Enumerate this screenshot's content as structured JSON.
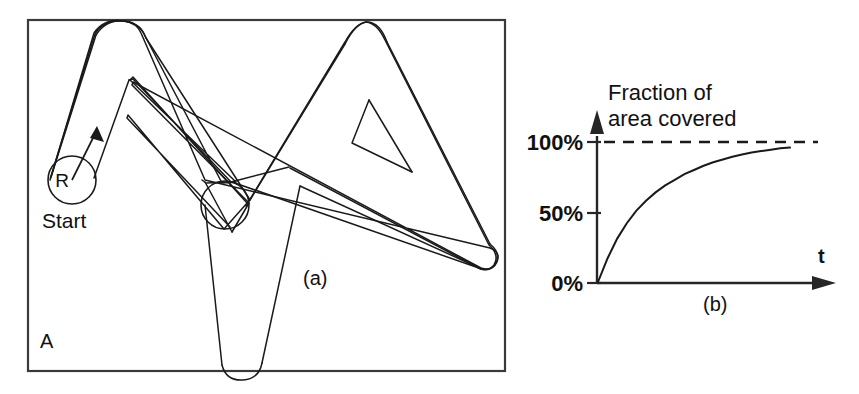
{
  "figure": {
    "panels": [
      {
        "id": "panel-a",
        "caption": "(a)",
        "region_label": "A",
        "start_label": "Start",
        "radius_label": "R",
        "description": "Coverage path of a disc robot inside region A"
      },
      {
        "id": "panel-b",
        "caption": "(b)",
        "title_line1": "Fraction of",
        "title_line2": "area covered",
        "x_axis_label": "t",
        "y_ticks": [
          "100%",
          "50%",
          "0%"
        ],
        "asymptote_label": "100%"
      }
    ],
    "colors": {
      "ink": "#1a1a1a",
      "frame": "#3a3a3a",
      "background": "#ffffff"
    }
  },
  "chart_data": {
    "type": "line",
    "title": "Fraction of area covered",
    "xlabel": "t",
    "ylabel": "Fraction of area covered",
    "xlim": [
      0,
      100
    ],
    "ylim": [
      0,
      110
    ],
    "ytick_values": [
      0,
      50,
      100
    ],
    "ytick_labels": [
      "0%",
      "50%",
      "100%"
    ],
    "xtick_labels": [],
    "grid": false,
    "legend": null,
    "annotations": [
      {
        "text": "100%",
        "type": "asymptote",
        "y": 100,
        "style": "dashed"
      },
      {
        "text": "(b)",
        "type": "panel-caption"
      }
    ],
    "series": [
      {
        "name": "fraction of area covered",
        "x": [
          0,
          5,
          10,
          15,
          20,
          25,
          30,
          35,
          40,
          45,
          50,
          55,
          60,
          65,
          70,
          75,
          80,
          85,
          90,
          95,
          100
        ],
        "y": [
          0,
          17,
          31,
          42,
          51,
          58,
          64,
          69,
          73,
          77,
          80,
          83,
          85.5,
          87.5,
          89.5,
          91,
          92.5,
          93.5,
          94.5,
          95.5,
          96
        ]
      }
    ]
  }
}
